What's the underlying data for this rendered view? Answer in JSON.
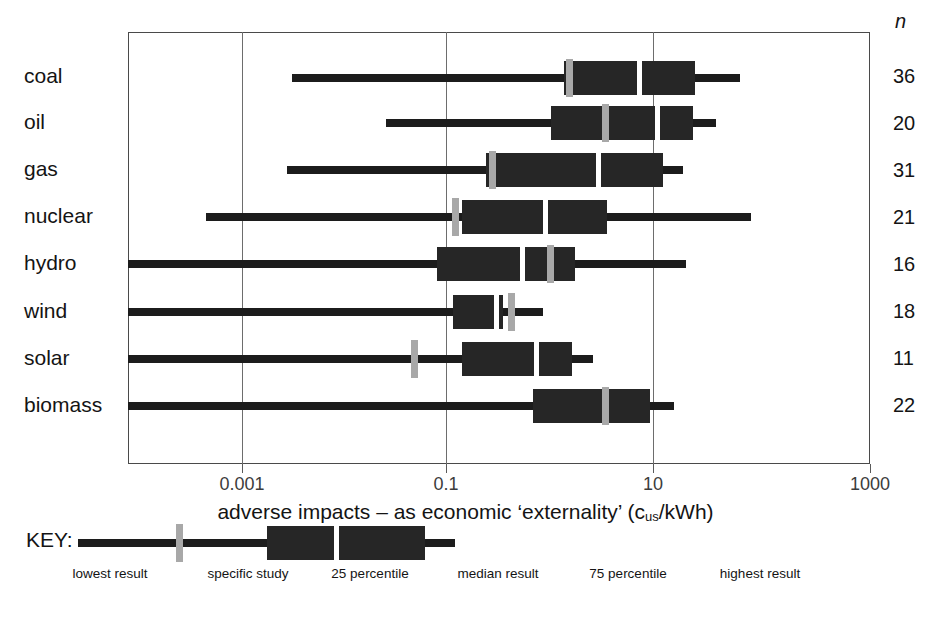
{
  "chart_data": {
    "type": "box",
    "title": "",
    "xlabel": "adverse impacts – as economic 'externality' (c_us/kWh)",
    "xlabel_parts": {
      "main_before": "adverse impacts – as economic ‘externality’ (c",
      "sub": "us",
      "main_after": "/kWh)"
    },
    "ylabel": "",
    "xscale": "log",
    "xlim": [
      0.0001,
      3000
    ],
    "xticks": [
      0.001,
      0.1,
      10,
      1000
    ],
    "xticklabels": [
      "0.001",
      "0.1",
      "10",
      "1000"
    ],
    "grid": "vertical gridlines at each labelled tick",
    "n_header": "n",
    "categories": [
      "coal",
      "oil",
      "gas",
      "nuclear",
      "hydro",
      "wind",
      "solar",
      "biomass"
    ],
    "n_values": [
      36,
      20,
      31,
      21,
      16,
      18,
      11,
      22
    ],
    "series": [
      {
        "name": "coal",
        "lowest": 0.0018,
        "p25": 3.2,
        "median": 9.0,
        "p75": 17.0,
        "highest": 30.0,
        "specific_study": 3.5
      },
      {
        "name": "oil",
        "lowest": 0.006,
        "p25": 2.0,
        "median": 6.0,
        "p75": 16.0,
        "highest": 22.0,
        "specific_study": 3.1
      },
      {
        "name": "gas",
        "lowest": 0.0017,
        "p25": 0.17,
        "median": 2.8,
        "p75": 11.0,
        "highest": 14.0,
        "specific_study": 0.17
      },
      {
        "name": "nuclear",
        "lowest": 0.0005,
        "p25": 0.13,
        "median": 1.3,
        "p75": 6.0,
        "highest": 25.0,
        "specific_study": 0.105
      },
      {
        "name": "hydro",
        "lowest": 0.0001,
        "p25": 0.1,
        "median": 1.5,
        "p75": 3.5,
        "highest": 40.0,
        "specific_study": 2.2
      },
      {
        "name": "wind",
        "lowest": 0.0001,
        "p25": 0.135,
        "median": 0.3,
        "p75": 0.33,
        "highest": 0.62,
        "specific_study": 0.38
      },
      {
        "name": "solar",
        "lowest": 0.0001,
        "p25": 0.14,
        "median": 0.85,
        "p75": 1.4,
        "highest": 1.8,
        "specific_study": 0.068
      },
      {
        "name": "biomass",
        "lowest": 0.0001,
        "p25": 0.5,
        "median": 4.0,
        "p75": 9.0,
        "highest": 17.0,
        "specific_study": 5.0
      }
    ],
    "pixel_geometry": {
      "comment": "positions measured off the source raster; x in page px",
      "axis": {
        "x_0p001": 242,
        "x_0p1": 446,
        "x_10": 653,
        "x_1000": 870,
        "px_per_decade": 52.3
      },
      "rows": [
        {
          "name": "coal",
          "top": 55,
          "whisker": [
            292,
            740
          ],
          "box": [
            564,
            695
          ],
          "median_x": 637,
          "study_x": 566
        },
        {
          "name": "oil",
          "top": 100,
          "whisker": [
            386,
            716
          ],
          "box": [
            551,
            693
          ],
          "median_x": 655,
          "study_x": 602
        },
        {
          "name": "gas",
          "top": 147,
          "whisker": [
            287,
            683
          ],
          "box": [
            486,
            663
          ],
          "median_x": 596,
          "study_x": 489
        },
        {
          "name": "nuclear",
          "top": 194,
          "whisker": [
            206,
            751
          ],
          "box": [
            462,
            607
          ],
          "median_x": 543,
          "study_x": 452
        },
        {
          "name": "hydro",
          "top": 241,
          "whisker": [
            128,
            686
          ],
          "box": [
            437,
            575
          ],
          "median_x": 520,
          "study_x": 547
        },
        {
          "name": "wind",
          "top": 289,
          "whisker": [
            128,
            543
          ],
          "box": [
            453,
            503
          ],
          "median_x": 494,
          "study_x": 508
        },
        {
          "name": "solar",
          "top": 336,
          "whisker": [
            128,
            593
          ],
          "box": [
            462,
            572
          ],
          "median_x": 534,
          "study_x": 411
        },
        {
          "name": "biomass",
          "top": 383,
          "whisker": [
            128,
            674
          ],
          "box": [
            533,
            650
          ],
          "median_x": 604,
          "study_x": 602
        }
      ],
      "key": {
        "whisker": [
          78,
          455
        ],
        "box": [
          267,
          425
        ],
        "median_x": 334,
        "study_x": 176
      }
    },
    "colors": {
      "box": "#262626",
      "whisker": "#1c1c1c",
      "median": "#ffffff",
      "specific_study": "#a8a8a8",
      "frame": "#4a4a4a",
      "gridline": "#6d6d6d",
      "text": "#141414"
    }
  },
  "key": {
    "title": "KEY:",
    "labels": [
      {
        "text": "lowest result",
        "x": 110
      },
      {
        "text": "specific study",
        "x": 248
      },
      {
        "text": "25 percentile",
        "x": 370
      },
      {
        "text": "median result",
        "x": 498
      },
      {
        "text": "75 percentile",
        "x": 628
      },
      {
        "text": "highest result",
        "x": 760
      }
    ]
  }
}
